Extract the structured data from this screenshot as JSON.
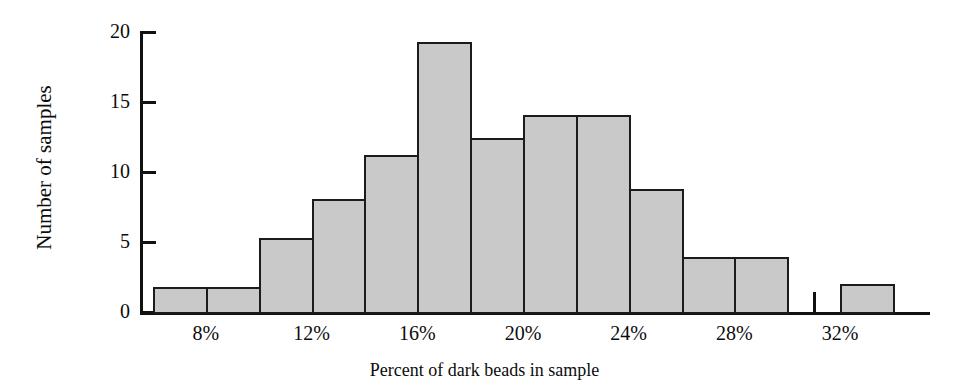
{
  "chart_data": {
    "type": "bar",
    "title": "",
    "subtitle": "",
    "xlabel": "Percent of dark beads in sample",
    "ylabel": "Number of samples",
    "grid": false,
    "legend": "none",
    "xlim": [
      6,
      34
    ],
    "ylim": [
      0,
      20
    ],
    "bin_width": 2,
    "bin_edges": [
      6,
      8,
      10,
      12,
      14,
      16,
      18,
      20,
      22,
      24,
      26,
      28,
      30,
      32,
      34
    ],
    "categories": [
      "6-8%",
      "8-10%",
      "10-12%",
      "12-14%",
      "14-16%",
      "16-18%",
      "18-20%",
      "20-22%",
      "22-24%",
      "24-26%",
      "26-28%",
      "28-30%",
      "30-32%",
      "32-34%"
    ],
    "values": [
      1.8,
      1.8,
      5.3,
      8.1,
      11.2,
      19.3,
      12.4,
      14.1,
      14.1,
      8.8,
      3.9,
      3.9,
      0,
      2.0
    ],
    "x_tick_labels": [
      "8%",
      "12%",
      "16%",
      "20%",
      "24%",
      "28%",
      "32%"
    ],
    "x_tick_values": [
      8,
      12,
      16,
      20,
      24,
      28,
      32
    ],
    "x_minor_tick_values": [
      7,
      9,
      11,
      13,
      15,
      17,
      19,
      21,
      23,
      25,
      27,
      29,
      31,
      33
    ],
    "y_tick_labels": [
      "0",
      "5",
      "10",
      "15",
      "20"
    ],
    "y_tick_values": [
      0,
      5,
      10,
      15,
      20
    ],
    "bar_fill_color": "#c9c9c9",
    "bar_edge_color": "#1b1b1b",
    "axis_color": "#111111"
  }
}
